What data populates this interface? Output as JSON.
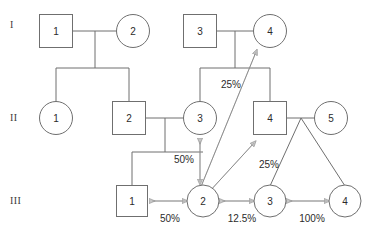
{
  "diagram": {
    "type": "pedigree",
    "colors": {
      "shape_stroke": "#6f6f6f",
      "shape_fill": "#ffffff",
      "line": "#6f6f6f",
      "arrow_fill": "#c6c6c6",
      "arrow_stroke": "#8d8d8d",
      "text": "#2b2b2b",
      "background": "#ffffff"
    },
    "generations": [
      {
        "id": "gen-I",
        "label": "I",
        "x": 10,
        "y": 25
      },
      {
        "id": "gen-II",
        "label": "II",
        "x": 10,
        "y": 118
      },
      {
        "id": "gen-III",
        "label": "III",
        "x": 10,
        "y": 201
      }
    ],
    "individuals": [
      {
        "id": "I-1",
        "label": "1",
        "shape": "square",
        "gen": "I",
        "cx": 56,
        "cy": 31,
        "size": 33
      },
      {
        "id": "I-2",
        "label": "2",
        "shape": "circle",
        "gen": "I",
        "cx": 133,
        "cy": 31,
        "size": 33
      },
      {
        "id": "I-3",
        "label": "3",
        "shape": "square",
        "gen": "I",
        "cx": 200,
        "cy": 31,
        "size": 33
      },
      {
        "id": "I-4",
        "label": "4",
        "shape": "circle",
        "gen": "I",
        "cx": 270,
        "cy": 31,
        "size": 33
      },
      {
        "id": "II-1",
        "label": "1",
        "shape": "circle",
        "gen": "II",
        "cx": 56,
        "cy": 118,
        "size": 33
      },
      {
        "id": "II-2",
        "label": "2",
        "shape": "square",
        "gen": "II",
        "cx": 129,
        "cy": 118,
        "size": 33
      },
      {
        "id": "II-3",
        "label": "3",
        "shape": "circle",
        "gen": "II",
        "cx": 200,
        "cy": 118,
        "size": 33
      },
      {
        "id": "II-4",
        "label": "4",
        "shape": "square",
        "gen": "II",
        "cx": 270,
        "cy": 118,
        "size": 33
      },
      {
        "id": "II-5",
        "label": "5",
        "shape": "circle",
        "gen": "II",
        "cx": 331,
        "cy": 118,
        "size": 33
      },
      {
        "id": "III-1",
        "label": "1",
        "shape": "square",
        "gen": "III",
        "cx": 132,
        "cy": 201,
        "size": 31
      },
      {
        "id": "III-2",
        "label": "2",
        "shape": "circle",
        "gen": "III",
        "cx": 203,
        "cy": 201,
        "size": 31
      },
      {
        "id": "III-3",
        "label": "3",
        "shape": "circle",
        "gen": "III",
        "cx": 270,
        "cy": 201,
        "size": 31
      },
      {
        "id": "III-4",
        "label": "4",
        "shape": "circle",
        "gen": "III",
        "cx": 345,
        "cy": 201,
        "size": 31
      }
    ],
    "relationship_arrows": [
      {
        "id": "arrow-III1-III2",
        "from": "III-1",
        "to": "III-2",
        "value": "50%",
        "orientation": "horizontal",
        "label_x": 170,
        "label_y": 218
      },
      {
        "id": "arrow-III2-III3",
        "from": "III-2",
        "to": "III-3",
        "value": "12.5%",
        "orientation": "horizontal",
        "label_x": 242,
        "label_y": 218
      },
      {
        "id": "arrow-III3-III4",
        "from": "III-3",
        "to": "III-4",
        "value": "100%",
        "orientation": "horizontal",
        "label_x": 312,
        "label_y": 218
      },
      {
        "id": "arrow-II3-III2",
        "from": "II-3",
        "to": "III-2",
        "value": "50%",
        "orientation": "vertical",
        "label_x": 184,
        "label_y": 159
      },
      {
        "id": "arrow-III2-I4",
        "from": "III-2",
        "to": "I-4",
        "value": "25%",
        "orientation": "diagonal",
        "label_x": 231,
        "label_y": 84
      },
      {
        "id": "arrow-III2-II4",
        "from": "III-2",
        "to": "II-4",
        "value": "25%",
        "orientation": "diagonal",
        "label_x": 269,
        "label_y": 164
      }
    ]
  }
}
